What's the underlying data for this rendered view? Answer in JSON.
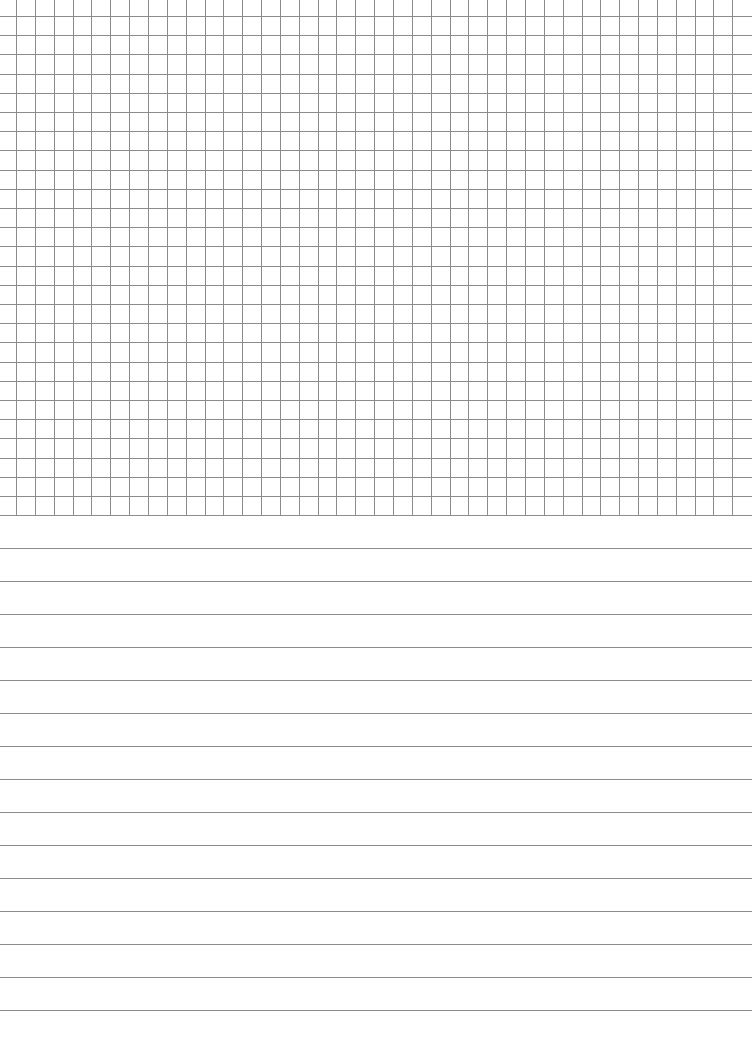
{
  "page": {
    "width": 755,
    "height": 1052,
    "background": "#ffffff"
  },
  "grid_section": {
    "line_color": "#8c8c8c",
    "vertical_lines": {
      "start_x": 16,
      "spacing": 18.85,
      "count": 39,
      "top": 0,
      "bottom": 516
    },
    "horizontal_lines": {
      "start_y": 16,
      "spacing": 19.2,
      "count": 27,
      "left": 0,
      "right": 752
    }
  },
  "ruled_section": {
    "line_color": "#8c8c8c",
    "start_y": 548,
    "spacing": 33.0,
    "count": 15,
    "left": 0,
    "right": 752
  }
}
